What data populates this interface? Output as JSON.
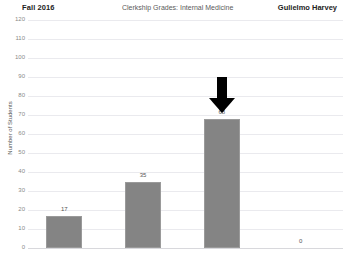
{
  "header": {
    "term": "Fall 2016",
    "title": "Clerkship Grades: Internal Medicine",
    "user": "Gulielmo Harvey"
  },
  "chart_data": {
    "type": "bar",
    "title": "Clerkship Grades: Internal Medicine",
    "xlabel": "",
    "ylabel": "Number of Students",
    "ylim": [
      0,
      120
    ],
    "yticks": [
      0,
      10,
      20,
      30,
      40,
      50,
      60,
      70,
      80,
      90,
      100,
      110,
      120
    ],
    "grid": true,
    "legend": "none",
    "categories": [
      "1",
      "2",
      "3",
      "4"
    ],
    "values": [
      17,
      35,
      68,
      0
    ],
    "data_labels": [
      "17",
      "35",
      "68",
      "0"
    ],
    "bar_color": "#848484",
    "annotations": [
      {
        "type": "arrow",
        "direction": "down",
        "color": "#000000",
        "target_category_index": 2,
        "target_value": 68
      }
    ]
  }
}
